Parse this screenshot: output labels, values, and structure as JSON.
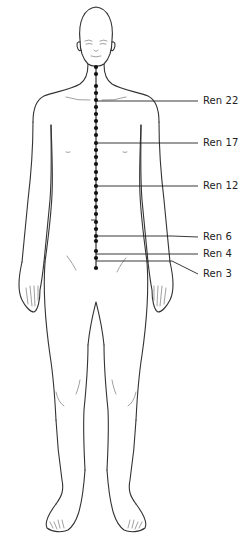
{
  "figure": {
    "meridian": {
      "name": "Ren",
      "color": "#111111",
      "path": {
        "x": 96,
        "y_start": 67,
        "y_end": 268
      },
      "points_y": [
        67,
        74,
        86,
        93,
        100,
        107,
        114,
        121,
        128,
        135,
        143,
        150,
        157,
        164,
        172,
        179,
        186,
        193,
        200,
        207,
        214,
        222,
        229,
        236,
        241,
        251,
        258,
        268
      ]
    },
    "labels": [
      {
        "id": "ren22",
        "text": "Ren 22",
        "y": 101,
        "point_y": 101
      },
      {
        "id": "ren17",
        "text": "Ren 17",
        "y": 143,
        "point_y": 143
      },
      {
        "id": "ren12",
        "text": "Ren 12",
        "y": 186,
        "point_y": 186
      },
      {
        "id": "ren6",
        "text": "Ren 6",
        "y": 237,
        "point_y": 236
      },
      {
        "id": "ren4",
        "text": "Ren 4",
        "y": 254,
        "point_y": 254
      },
      {
        "id": "ren3",
        "text": "Ren 3",
        "y": 274,
        "point_y": 261
      }
    ]
  }
}
